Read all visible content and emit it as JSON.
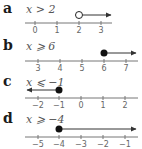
{
  "colors": {
    "axis": "#777777",
    "ray": "#333333",
    "dot": "#111111",
    "text": "#555555",
    "label": "#1a1a1a"
  },
  "items": [
    {
      "label": "a",
      "inequality": "x > 2",
      "ticks": [
        "0",
        "1",
        "2",
        "3"
      ],
      "point": "open",
      "direction": "right",
      "boundary": 2
    },
    {
      "label": "b",
      "inequality": "x ⩾ 6",
      "ticks": [
        "3",
        "4",
        "5",
        "6",
        "7"
      ],
      "point": "closed",
      "direction": "right",
      "boundary": 6
    },
    {
      "label": "c",
      "inequality": "x ⩽ −1",
      "ticks": [
        "−2",
        "−1",
        "0",
        "1",
        "2"
      ],
      "point": "closed",
      "direction": "left",
      "boundary": -1
    },
    {
      "label": "d",
      "inequality": "x ⩾ −4",
      "ticks": [
        "−5",
        "−4",
        "−3",
        "−2",
        "−1"
      ],
      "point": "closed",
      "direction": "right",
      "boundary": -4
    }
  ]
}
